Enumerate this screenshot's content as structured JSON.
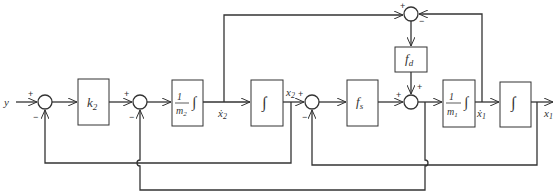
{
  "diagram": {
    "type": "control block diagram",
    "input_label": "y",
    "blocks": [
      {
        "id": "k2",
        "label": "k",
        "sub": "2"
      },
      {
        "id": "inv_m2_int",
        "num": "1",
        "den": "m",
        "den_sub": "2",
        "op": "∫"
      },
      {
        "id": "int1",
        "op": "∫"
      },
      {
        "id": "fs",
        "label": "f",
        "sub": "s"
      },
      {
        "id": "fd",
        "label": "f",
        "sub": "d"
      },
      {
        "id": "inv_m1_int",
        "num": "1",
        "den": "m",
        "den_sub": "1",
        "op": "∫"
      },
      {
        "id": "int2",
        "op": "∫"
      }
    ],
    "signals": {
      "x2dot": {
        "label": "ẋ",
        "sub": "2"
      },
      "x2": {
        "label": "x",
        "sub": "2"
      },
      "x1dot": {
        "label": "ẋ",
        "sub": "1"
      },
      "x1": {
        "label": "x",
        "sub": "1"
      }
    },
    "sums": [
      {
        "id": "s1",
        "signs": [
          "+",
          "−"
        ]
      },
      {
        "id": "s2",
        "signs": [
          "+",
          "−"
        ]
      },
      {
        "id": "s3",
        "signs": [
          "+",
          "−"
        ]
      },
      {
        "id": "s4",
        "signs": [
          "+",
          "+"
        ]
      },
      {
        "id": "s_top",
        "signs": [
          "+",
          "−"
        ]
      }
    ],
    "plus": "+",
    "minus": "−"
  }
}
